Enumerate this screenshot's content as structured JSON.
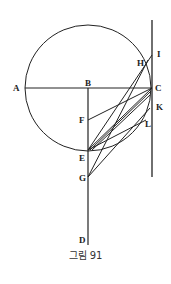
{
  "figure": {
    "caption": "그림 91",
    "labels": {
      "A": "A",
      "B": "B",
      "C": "C",
      "D": "D",
      "E": "E",
      "F": "F",
      "G": "G",
      "H": "H",
      "I": "I",
      "K": "K",
      "L": "L"
    },
    "stroke_color": "#222222"
  }
}
